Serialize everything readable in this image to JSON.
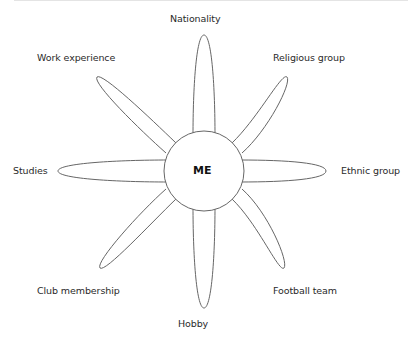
{
  "diagram": {
    "type": "radial-flower",
    "center_label": "ME",
    "stroke_color": "#666666",
    "petals": [
      {
        "id": "n",
        "label": "Nationality"
      },
      {
        "id": "ne",
        "label": "Religious group"
      },
      {
        "id": "e",
        "label": "Ethnic group"
      },
      {
        "id": "se",
        "label": "Football team"
      },
      {
        "id": "s",
        "label": "Hobby"
      },
      {
        "id": "sw",
        "label": "Club membership"
      },
      {
        "id": "w",
        "label": "Studies"
      },
      {
        "id": "nw",
        "label": "Work experience"
      }
    ]
  }
}
